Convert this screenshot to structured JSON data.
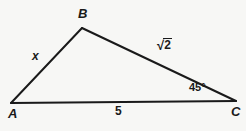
{
  "figure": {
    "type": "triangle-diagram",
    "background_color": "#f7f7f5",
    "stroke_color": "#1a1a1a",
    "text_color": "#1a1a1a"
  },
  "vertices": [
    {
      "name": "A",
      "label": "A",
      "x": 11,
      "y": 103,
      "label_x": 8,
      "label_y": 107
    },
    {
      "name": "B",
      "label": "B",
      "x": 82,
      "y": 28,
      "label_x": 78,
      "label_y": 7
    },
    {
      "name": "C",
      "label": "C",
      "x": 236,
      "y": 101,
      "label_x": 231,
      "label_y": 105
    }
  ],
  "sides": [
    {
      "name": "AB",
      "label": "x",
      "italic": true,
      "label_x": 32,
      "label_y": 50
    },
    {
      "name": "BC",
      "label": "√2",
      "radical_sign": "√",
      "radicand": "2",
      "label_x": 157,
      "label_y": 38
    },
    {
      "name": "AC",
      "label": "5",
      "italic": false,
      "label_x": 115,
      "label_y": 105
    }
  ],
  "angles": [
    {
      "at_vertex": "C",
      "label": "45°",
      "value": 45,
      "unit": "degrees",
      "label_x": 189,
      "label_y": 82
    }
  ]
}
